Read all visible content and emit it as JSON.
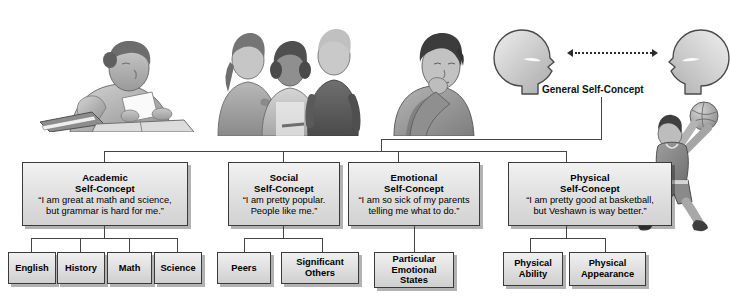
{
  "figure": {
    "root_label": "General Self-Concept"
  },
  "heads": {
    "left_name": "head-silhouette-left",
    "right_name": "head-silhouette-right",
    "connector": "dotted-double-arrow"
  },
  "illustrations": [
    {
      "name": "student-studying-illustration",
      "caption": "Girl reading at desk with books"
    },
    {
      "name": "teens-group-illustration",
      "caption": "Three teenagers standing together"
    },
    {
      "name": "pensive-person-illustration",
      "caption": "Person resting chin on hand, thinking"
    },
    {
      "name": "basketball-player-illustration",
      "caption": "Boy shooting a basketball"
    }
  ],
  "branches": [
    {
      "id": "academic",
      "title": "Academic\nSelf-Concept",
      "quote": "“I am great at math and science,\nbut grammar is hard for me.”",
      "children": [
        "English",
        "History",
        "Math",
        "Science"
      ]
    },
    {
      "id": "social",
      "title": "Social\nSelf-Concept",
      "quote": "“I am pretty popular.\nPeople like me.”",
      "children": [
        "Peers",
        "Significant\nOthers"
      ]
    },
    {
      "id": "emotional",
      "title": "Emotional\nSelf-Concept",
      "quote": "“I am so sick of my parents\ntelling me what to do.”",
      "children": [
        "Particular\nEmotional\nStates"
      ]
    },
    {
      "id": "physical",
      "title": "Physical\nSelf-Concept",
      "quote": "“I am pretty good at basketball,\nbut Veshawn is way better.”",
      "children": [
        "Physical\nAbility",
        "Physical\nAppearance"
      ]
    }
  ],
  "colors": {
    "box_border": "#3a3a3a",
    "box_fill_top": "#f2f2f2",
    "box_fill_bottom": "#d2d2d2",
    "line": "#444444",
    "text": "#000000",
    "background": "#ffffff"
  }
}
